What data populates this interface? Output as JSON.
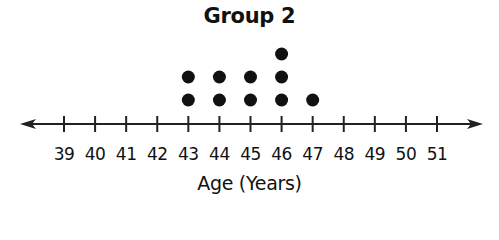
{
  "chart_data": {
    "type": "dot_plot",
    "title": "Group 2",
    "xlabel": "Age (Years)",
    "ylabel": "",
    "xlim": [
      39,
      51
    ],
    "ticks": [
      39,
      40,
      41,
      42,
      43,
      44,
      45,
      46,
      47,
      48,
      49,
      50,
      51
    ],
    "tick_labels": [
      "39",
      "40",
      "41",
      "42",
      "43",
      "44",
      "45",
      "46",
      "47",
      "48",
      "49",
      "50",
      "51"
    ],
    "counts": {
      "43": 2,
      "44": 2,
      "45": 2,
      "46": 3,
      "47": 1
    },
    "values": [
      43,
      43,
      44,
      44,
      45,
      45,
      46,
      46,
      46,
      47
    ],
    "grid": false,
    "axis_arrows": "both",
    "dot_color": "#111111",
    "axis_color": "#222222"
  }
}
